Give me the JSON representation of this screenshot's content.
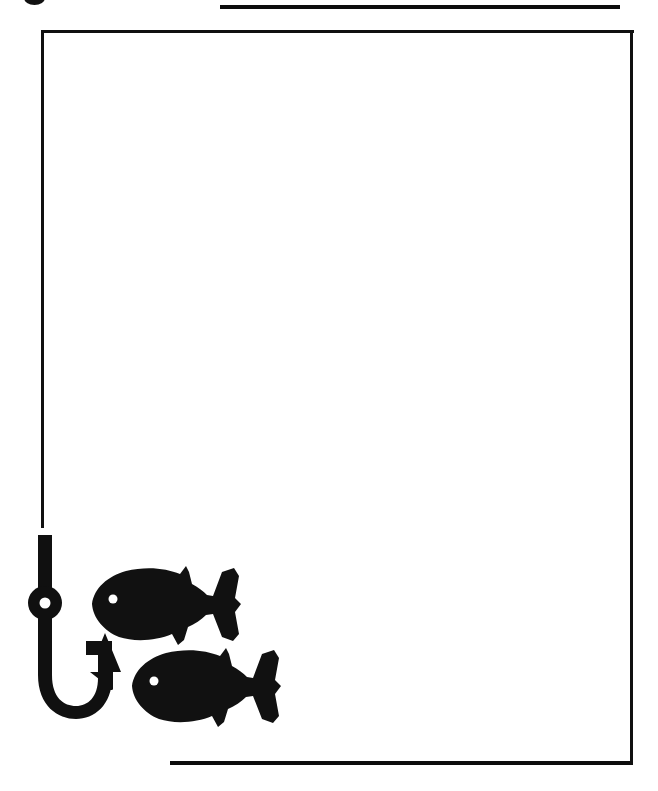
{
  "page": {
    "background_color": "#ffffff",
    "ink_color": "#101010",
    "width": 658,
    "height": 791
  },
  "decorations": {
    "top_rule": {
      "label": "Top horizontal rule",
      "x": 220,
      "y": 5,
      "width": 400,
      "thickness": 4
    },
    "bottom_rule": {
      "label": "Bottom horizontal rule",
      "x": 170,
      "y": 761,
      "width": 462,
      "thickness": 4
    },
    "top_left_mark": {
      "label": "Cropped ink mark",
      "x": 24,
      "y": -9
    }
  },
  "frame": {
    "label": "Page border frame",
    "top": {
      "x": 41,
      "y": 30,
      "width": 593
    },
    "right": {
      "x": 630,
      "y": 30,
      "height": 735
    },
    "left": {
      "x": 41,
      "y": 30,
      "height": 498
    },
    "note": "open on the bottom-left where the fishing line becomes the hook"
  },
  "artwork": {
    "caption": "Fishing hook and two fish silhouettes",
    "hook": {
      "name": "fishing-hook",
      "line_color": "#101010",
      "parts": [
        "line",
        "shank",
        "eye-ring",
        "eye-hole",
        "bend",
        "point",
        "barb"
      ],
      "shank_x": 45,
      "shank_top_y": 535,
      "eye_center": {
        "x": 45,
        "y": 603
      },
      "eye_hole_radius": 5,
      "bend_bottom_y": 715
    },
    "fish": [
      {
        "name": "fish-upper",
        "facing": "left",
        "fill": "#111111",
        "eye_color": "#ffffff",
        "x": 92,
        "y": 566,
        "width": 150,
        "height": 78,
        "eye": {
          "x": 113,
          "y": 599,
          "radius": 4
        }
      },
      {
        "name": "fish-lower",
        "facing": "left",
        "fill": "#111111",
        "eye_color": "#ffffff",
        "x": 132,
        "y": 648,
        "width": 150,
        "height": 78,
        "eye": {
          "x": 154,
          "y": 681,
          "radius": 4
        }
      }
    ]
  }
}
